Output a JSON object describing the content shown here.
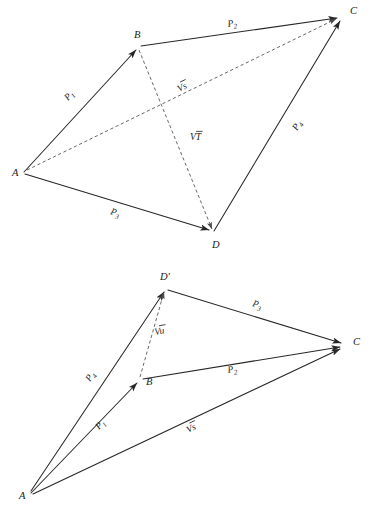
{
  "figure": {
    "kind": "vector-diagram-pair",
    "background_color": "#ffffff",
    "ink_color": "#262626",
    "dashed_color": "#4a4a4a"
  },
  "diagrams": [
    {
      "id": "top",
      "name": "quadrilateral-abcd",
      "vertices": [
        {
          "key": "A",
          "label": "A",
          "x": 24,
          "y": 172,
          "label_x": 12,
          "label_y": 176
        },
        {
          "key": "B",
          "label": "B",
          "x": 139,
          "y": 47,
          "label_x": 134,
          "label_y": 38
        },
        {
          "key": "C",
          "label": "C",
          "x": 341,
          "y": 17,
          "label_x": 350,
          "label_y": 14
        },
        {
          "key": "D",
          "label": "D",
          "x": 213,
          "y": 233,
          "label_x": 212,
          "label_y": 248
        }
      ],
      "edges": [
        {
          "key": "AB",
          "label": "P",
          "sub": "1",
          "from": "A",
          "to": "B",
          "style": "solid",
          "label_x": 68,
          "label_y": 101
        },
        {
          "key": "BC",
          "label": "P",
          "sub": "2",
          "from": "B",
          "to": "C",
          "style": "solid",
          "label_x": 228,
          "label_y": 27
        },
        {
          "key": "AD",
          "label": "P",
          "sub": "3",
          "from": "A",
          "to": "D",
          "style": "solid",
          "label_x": 110,
          "label_y": 214
        },
        {
          "key": "DC",
          "label": "P",
          "sub": "4",
          "from": "D",
          "to": "C",
          "style": "solid",
          "label_x": 297,
          "label_y": 131
        },
        {
          "key": "AC",
          "label": "Vs",
          "from": "A",
          "to": "C",
          "style": "dashed",
          "label_x": 179,
          "label_y": 92
        },
        {
          "key": "BD",
          "label": "VT",
          "from": "B",
          "to": "D",
          "style": "dashed",
          "label_x": 190,
          "label_y": 140
        }
      ]
    },
    {
      "id": "bottom",
      "name": "triangle-fan-abcd-prime",
      "vertices": [
        {
          "key": "A",
          "label": "A",
          "x": 31,
          "y": 493,
          "label_x": 19,
          "label_y": 499
        },
        {
          "key": "B",
          "label": "B",
          "x": 140,
          "y": 380,
          "label_x": 146,
          "label_y": 385
        },
        {
          "key": "C",
          "label": "C",
          "x": 344,
          "y": 346,
          "label_x": 353,
          "label_y": 345
        },
        {
          "key": "Dp",
          "label": "D'",
          "x": 165,
          "y": 288,
          "label_x": 160,
          "label_y": 280
        }
      ],
      "edges": [
        {
          "key": "AB",
          "label": "P",
          "sub": "1",
          "from": "A",
          "to": "B",
          "style": "solid",
          "label_x": 99,
          "label_y": 430
        },
        {
          "key": "BC",
          "label": "P",
          "sub": "2",
          "from": "B",
          "to": "C",
          "style": "solid",
          "label_x": 228,
          "label_y": 373
        },
        {
          "key": "DpC",
          "label": "P",
          "sub": "3",
          "from": "Dp",
          "to": "C",
          "style": "solid",
          "label_x": 252,
          "label_y": 306
        },
        {
          "key": "ADp",
          "label": "P",
          "sub": "4",
          "from": "A",
          "to": "Dp",
          "style": "solid",
          "label_x": 90,
          "label_y": 382
        },
        {
          "key": "AC",
          "label": "Vs",
          "from": "A",
          "to": "C",
          "style": "solid",
          "label_x": 188,
          "label_y": 433
        },
        {
          "key": "BDp",
          "label": "Vu",
          "from": "B",
          "to": "Dp",
          "style": "dashed",
          "label_x": 155,
          "label_y": 335
        }
      ]
    }
  ],
  "labels": {
    "vertex_A": "A",
    "vertex_B": "B",
    "vertex_C": "C",
    "vertex_D": "D",
    "vertex_D_prime": "D'",
    "p1": "P",
    "p2": "P",
    "p3": "P",
    "p4": "P",
    "sub1": "1",
    "sub2": "2",
    "sub3": "3",
    "sub4": "4",
    "vec_V": "V",
    "vec_s": "s",
    "vec_T": "T",
    "vec_u": "u"
  }
}
